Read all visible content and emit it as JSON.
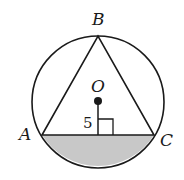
{
  "diagram": {
    "type": "inscribed-triangle-in-circle",
    "colors": {
      "stroke": "#1a1a1a",
      "shade": "#c8c8c8",
      "background": "#ffffff"
    },
    "circle": {
      "center_label": "O",
      "cx": 98,
      "cy": 102,
      "r": 66
    },
    "points": {
      "A": {
        "label": "A",
        "x": 42,
        "y": 135
      },
      "B": {
        "label": "B",
        "x": 98,
        "y": 36
      },
      "C": {
        "label": "C",
        "x": 154,
        "y": 135
      }
    },
    "perpendicular": {
      "label": "5",
      "from": "O",
      "to_chord": "AC"
    },
    "shaded_region": "segment below chord AC"
  }
}
